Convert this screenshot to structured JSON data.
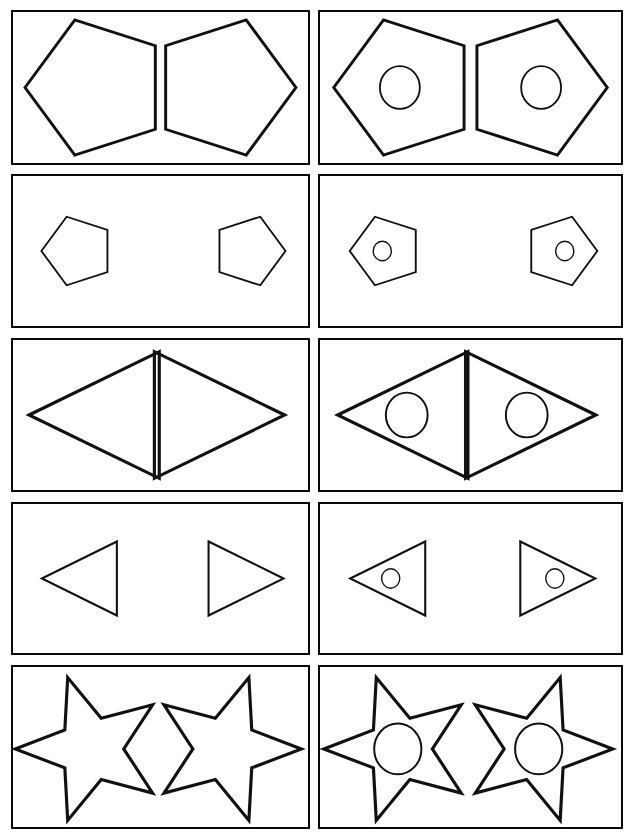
{
  "document": {
    "kind": "worksheet",
    "title": "Shape discrimination worksheet",
    "page_background": "#ffffff",
    "ink_color": "#111111",
    "border_color": "#0a0a0a",
    "width": 634,
    "height": 839,
    "columns": 2,
    "rows": 5,
    "instruction_text": ""
  },
  "layout": {
    "cols": [
      {
        "name": "left-column",
        "x": 11,
        "width": 299
      },
      {
        "name": "right-column",
        "x": 318,
        "width": 305
      }
    ],
    "rows": [
      {
        "name": "row-1-pentagons-large",
        "y": 10,
        "height": 155
      },
      {
        "name": "row-2-pentagons-small",
        "y": 174,
        "height": 154
      },
      {
        "name": "row-3-triangles-large",
        "y": 338,
        "height": 154
      },
      {
        "name": "row-4-triangles-small",
        "y": 502,
        "height": 153
      },
      {
        "name": "row-5-stars",
        "y": 665,
        "height": 164
      }
    ]
  },
  "cells": [
    {
      "id": "r1c1",
      "row": 1,
      "column": 1,
      "name": "cell-pentagons-large-plain",
      "shape": "pentagon",
      "size": "large",
      "has_inner_circle": false,
      "shapes": [
        {
          "name": "pentagon-point-left",
          "direction": "left"
        },
        {
          "name": "pentagon-point-right",
          "direction": "right"
        }
      ]
    },
    {
      "id": "r1c2",
      "row": 1,
      "column": 2,
      "name": "cell-pentagons-large-with-circle",
      "shape": "pentagon",
      "size": "large",
      "has_inner_circle": true,
      "shapes": [
        {
          "name": "pentagon-point-left",
          "direction": "left"
        },
        {
          "name": "pentagon-point-right",
          "direction": "right"
        }
      ]
    },
    {
      "id": "r2c1",
      "row": 2,
      "column": 1,
      "name": "cell-pentagons-small-plain",
      "shape": "pentagon",
      "size": "small",
      "has_inner_circle": false,
      "shapes": [
        {
          "name": "pentagon-point-left",
          "direction": "left"
        },
        {
          "name": "pentagon-point-right",
          "direction": "right"
        }
      ]
    },
    {
      "id": "r2c2",
      "row": 2,
      "column": 2,
      "name": "cell-pentagons-small-with-circle",
      "shape": "pentagon",
      "size": "small",
      "has_inner_circle": true,
      "shapes": [
        {
          "name": "pentagon-point-left",
          "direction": "left"
        },
        {
          "name": "pentagon-point-right",
          "direction": "right"
        }
      ]
    },
    {
      "id": "r3c1",
      "row": 3,
      "column": 1,
      "name": "cell-triangles-large-plain",
      "shape": "triangle",
      "size": "large",
      "has_inner_circle": false,
      "shapes": [
        {
          "name": "triangle-point-left",
          "direction": "left"
        },
        {
          "name": "triangle-point-right",
          "direction": "right"
        }
      ]
    },
    {
      "id": "r3c2",
      "row": 3,
      "column": 2,
      "name": "cell-triangles-large-with-circle",
      "shape": "triangle",
      "size": "large",
      "has_inner_circle": true,
      "shapes": [
        {
          "name": "triangle-point-left",
          "direction": "left"
        },
        {
          "name": "triangle-point-right",
          "direction": "right"
        }
      ]
    },
    {
      "id": "r4c1",
      "row": 4,
      "column": 1,
      "name": "cell-triangles-small-plain",
      "shape": "triangle",
      "size": "small",
      "has_inner_circle": false,
      "shapes": [
        {
          "name": "triangle-point-left",
          "direction": "left"
        },
        {
          "name": "triangle-point-right",
          "direction": "right"
        }
      ]
    },
    {
      "id": "r4c2",
      "row": 4,
      "column": 2,
      "name": "cell-triangles-small-with-circle",
      "shape": "triangle",
      "size": "small",
      "has_inner_circle": true,
      "shapes": [
        {
          "name": "triangle-point-left",
          "direction": "left"
        },
        {
          "name": "triangle-point-right",
          "direction": "right"
        }
      ]
    },
    {
      "id": "r5c1",
      "row": 5,
      "column": 1,
      "name": "cell-stars-plain",
      "shape": "star",
      "size": "large",
      "has_inner_circle": false,
      "shapes": [
        {
          "name": "star-point-left",
          "direction": "left"
        },
        {
          "name": "star-point-right",
          "direction": "right"
        }
      ]
    },
    {
      "id": "r5c2",
      "row": 5,
      "column": 2,
      "name": "cell-stars-with-circle",
      "shape": "star",
      "size": "large",
      "has_inner_circle": true,
      "shapes": [
        {
          "name": "star-point-left",
          "direction": "left"
        },
        {
          "name": "star-point-right",
          "direction": "right"
        }
      ]
    }
  ]
}
